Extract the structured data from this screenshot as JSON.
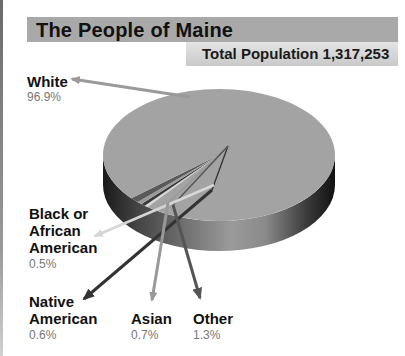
{
  "chart_data": {
    "type": "pie",
    "title": "The People of Maine",
    "subtitle": "Total Population 1,317,253",
    "slices": [
      {
        "label": "White",
        "value": 96.9,
        "value_label": "96.9%"
      },
      {
        "label": "Black or African American",
        "value": 0.5,
        "value_label": "0.5%"
      },
      {
        "label": "Native American",
        "value": 0.6,
        "value_label": "0.6%"
      },
      {
        "label": "Asian",
        "value": 0.7,
        "value_label": "0.7%"
      },
      {
        "label": "Other",
        "value": 1.3,
        "value_label": "1.3%"
      }
    ],
    "style": "3d",
    "colors": {
      "White": "#a3a3a3",
      "Black or African American": "#d8d8d8",
      "Native American": "#3a3a3a",
      "Asian": "#9a9a9a",
      "Other": "#5a5a5a"
    }
  },
  "labels": {
    "white": {
      "line1": "White",
      "pct": "96.9%"
    },
    "black": {
      "line1": "Black or",
      "line2": "African",
      "line3": "American",
      "pct": "0.5%"
    },
    "native": {
      "line1": "Native",
      "line2": "American",
      "pct": "0.6%"
    },
    "asian": {
      "line1": "Asian",
      "pct": "0.7%"
    },
    "other": {
      "line1": "Other",
      "pct": "1.3%"
    }
  }
}
